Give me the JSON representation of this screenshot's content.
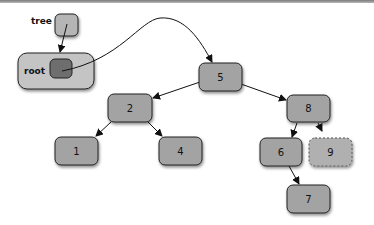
{
  "diagram": {
    "type": "binary-search-tree",
    "variable": {
      "label": "tree"
    },
    "wrapper": {
      "label": "root"
    },
    "nodes": [
      {
        "id": "n5",
        "value": "5"
      },
      {
        "id": "n2",
        "value": "2"
      },
      {
        "id": "n8",
        "value": "8"
      },
      {
        "id": "n1",
        "value": "1"
      },
      {
        "id": "n4",
        "value": "4"
      },
      {
        "id": "n6",
        "value": "6"
      },
      {
        "id": "n9",
        "value": "9",
        "style": "dashed"
      },
      {
        "id": "n7",
        "value": "7"
      }
    ],
    "edges": [
      {
        "from": "tree",
        "to": "root"
      },
      {
        "from": "root",
        "to": "5"
      },
      {
        "from": "5",
        "to": "2"
      },
      {
        "from": "5",
        "to": "8"
      },
      {
        "from": "2",
        "to": "1"
      },
      {
        "from": "2",
        "to": "4"
      },
      {
        "from": "8",
        "to": "6"
      },
      {
        "from": "8",
        "to": "9"
      },
      {
        "from": "6",
        "to": "7"
      }
    ],
    "colors": {
      "node_fill": "#a3a3a3",
      "node_stroke": "#222222",
      "inner_fill": "#6e6e6e",
      "wrapper_fill": "#c4c4c4"
    }
  }
}
